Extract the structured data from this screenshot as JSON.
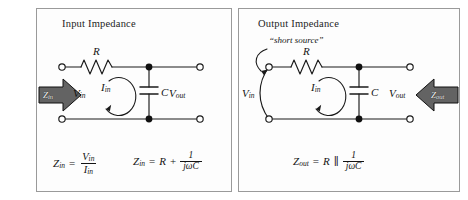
{
  "figure": {
    "type": "circuit-diagram-pair"
  },
  "panels": [
    {
      "id": "input-impedance",
      "title": "Input Impedance",
      "components": {
        "resistor_label": "R",
        "capacitor_label": "C",
        "input_voltage": "V",
        "input_voltage_sub": "in",
        "output_voltage": "V",
        "output_voltage_sub": "out",
        "loop_current": "I",
        "loop_current_sub": "in"
      },
      "block_arrow": {
        "symbol": "Z",
        "sub": "in",
        "direction": "right",
        "color": "#636363"
      },
      "formulas": [
        {
          "lhs": "Z",
          "lhs_sub": "in",
          "equals": "=",
          "numerator": "V",
          "numerator_sub": "in",
          "denominator": "I",
          "denominator_sub": "in"
        },
        {
          "lhs": "Z",
          "lhs_sub": "in",
          "equals": "=",
          "term1": "R",
          "operator": "+",
          "numerator": "1",
          "denominator": "jωC"
        }
      ]
    },
    {
      "id": "output-impedance",
      "title": "Output Impedance",
      "annotation": "“short source”",
      "components": {
        "resistor_label": "R",
        "capacitor_label": "C",
        "input_voltage": "V",
        "input_voltage_sub": "in",
        "output_voltage": "V",
        "output_voltage_sub": "out",
        "loop_current": "I",
        "loop_current_sub": "in"
      },
      "block_arrow": {
        "symbol": "Z",
        "sub": "out",
        "direction": "left",
        "color": "#636363"
      },
      "formulas": [
        {
          "lhs": "Z",
          "lhs_sub": "out",
          "equals": "=",
          "term1": "R",
          "operator": "∥",
          "numerator": "1",
          "denominator": "jωC"
        }
      ]
    }
  ],
  "colors": {
    "background": "#ffffff",
    "panel_background": "#fdfdfd",
    "panel_border": "#9a9a9a",
    "wire": "#1a1a1a",
    "arrow_fill": "#636363",
    "text": "#141414"
  }
}
